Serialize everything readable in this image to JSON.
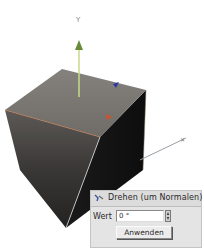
{
  "viewport": {
    "axes": {
      "y_label": "Y",
      "x_label": "X"
    },
    "colors": {
      "y_axis": "#9cc05a",
      "x_axis_handle": "#d0502a",
      "z_axis_handle": "#2c3aa0",
      "edge_highlight": "#c07a50",
      "cube_top": "#7a7874",
      "cube_front": "#3a3836",
      "cube_right": "#151515"
    }
  },
  "tool_panel": {
    "icon": "rotate-normal-icon",
    "title": "Drehen (um Normalen)",
    "value_label": "Wert",
    "value": "0 °",
    "apply_label": "Anwenden"
  }
}
